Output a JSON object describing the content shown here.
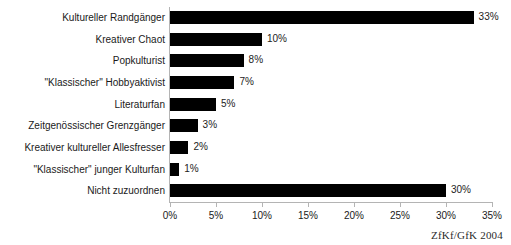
{
  "chart_data": {
    "type": "bar",
    "orientation": "horizontal",
    "title": "",
    "subtitle": "",
    "xlabel": "",
    "ylabel": "",
    "xlim": [
      0,
      35
    ],
    "xtick_labels": [
      "0%",
      "5%",
      "10%",
      "15%",
      "20%",
      "25%",
      "30%",
      "35%"
    ],
    "xticks": [
      0,
      5,
      10,
      15,
      20,
      25,
      30,
      35
    ],
    "grid": false,
    "legend": null,
    "bar_color": "#000000",
    "background_color": "#ffffff",
    "axis_color": "#b4b4b4",
    "categories": [
      "Kultureller Randgänger",
      "Kreativer Chaot",
      "Popkulturist",
      "\"Klassischer\" Hobbyaktivist",
      "Literaturfan",
      "Zeitgenössischer Grenzgänger",
      "Kreativer kultureller Allesfresser",
      "\"Klassischer\" junger Kulturfan",
      "Nicht zuzuordnen"
    ],
    "values": [
      33,
      10,
      8,
      7,
      5,
      3,
      2,
      1,
      30
    ],
    "value_labels": [
      "33%",
      "10%",
      "8%",
      "7%",
      "5%",
      "3%",
      "2%",
      "1%",
      "30%"
    ]
  },
  "footer": {
    "source_credit": "ZfKf/GfK 2004"
  }
}
